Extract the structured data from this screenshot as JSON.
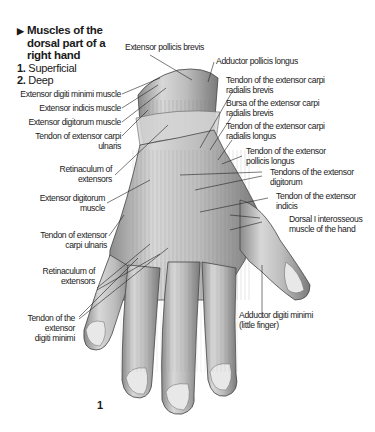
{
  "title": "Muscles of the dorsal part of a right hand",
  "legend": [
    {
      "number": "1.",
      "label": "Superficial"
    },
    {
      "number": "2.",
      "label": "Deep"
    }
  ],
  "figure_number": "1",
  "labels": {
    "extensor_pollicis_brevis": "Extensor pollicis brevis",
    "adductor_pollicis_longus": "Adductor pollicis longus",
    "tendon_ecr_brevis": [
      "Tendon of the extensor carpi",
      "radialis brevis"
    ],
    "bursa_ecr_brevis": [
      "Bursa of the extensor carpi",
      "radialis brevis"
    ],
    "tendon_ecr_longus": [
      "Tendon of the extensor carpi",
      "radialis longus"
    ],
    "tendon_epl": [
      "Tendon of the extensor",
      "pollicis longus"
    ],
    "tendons_ed": [
      "Tendons of the extensor",
      "digitorum"
    ],
    "tendon_ei": [
      "Tendon of the extensor",
      "indicis"
    ],
    "dorsal_interosseous": [
      "Dorsal I interosseous",
      "muscle of the hand"
    ],
    "adductor_digiti_minimi": [
      "Adductor digiti minimi",
      "(little finger)"
    ],
    "extensor_digiti_minimi_muscle": "Extensor digiti minimi muscle",
    "extensor_indicis_muscle": "Extensor indicis muscle",
    "extensor_digitorum_muscle": "Extensor digitorum muscle",
    "tendon_ecu_1": [
      "Tendon of extensor carpi",
      "ulnaris"
    ],
    "retinaculum_1": [
      "Retinaculum of",
      "extensors"
    ],
    "extensor_digitorum_muscle_2": [
      "Extensor digitorum",
      "muscle"
    ],
    "tendon_ecu_2": [
      "Tendon of extensor",
      "carpi ulnaris"
    ],
    "retinaculum_2": [
      "Retinaculum of",
      "extensors"
    ],
    "tendon_edm": [
      "Tendon of the",
      "extensor",
      "digiti minimi"
    ]
  }
}
